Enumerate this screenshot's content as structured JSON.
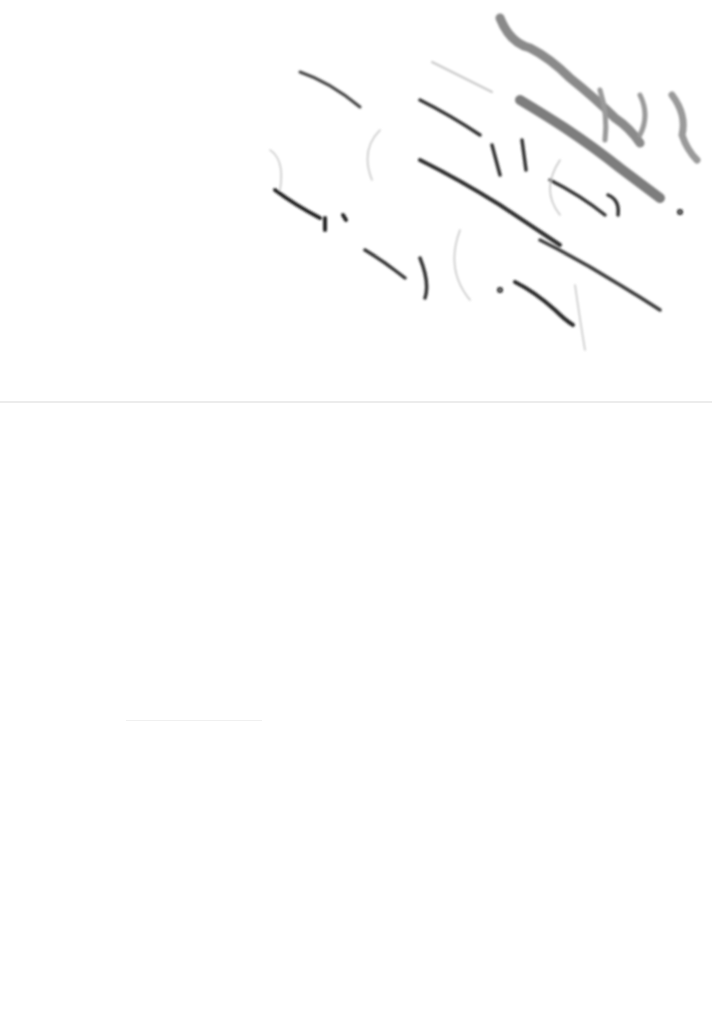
{
  "document": {
    "type": "scanned handwritten page (mirrored ink bleed-through)",
    "legibility": "illegible",
    "handwriting_region": "upper-right, diagonal lines",
    "ink_colors": {
      "heavy": "#7a7a7a",
      "dark": "#2a2a2a",
      "light": "#b5b5b5"
    },
    "background_color": "#ffffff",
    "fold_line_color": "#ececec"
  }
}
